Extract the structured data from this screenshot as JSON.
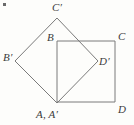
{
  "figure": {
    "background_color": "#fdfdfb",
    "stroke_color": "#7a7a7a",
    "label_color": "#3b3b3b",
    "stroke_width": 1
  },
  "labels": {
    "A": "A, A′",
    "B": "B",
    "C": "C",
    "D": "D",
    "Bp": "B′",
    "Cp": "C′",
    "Dp": "D′"
  },
  "shapes": {
    "square_ABCD": {
      "name": "square ABCD",
      "points": "57,41 115,41 115,102 57,102",
      "vertices": {
        "A": [
          57,
          102
        ],
        "B": [
          57,
          41
        ],
        "C": [
          115,
          41
        ],
        "D": [
          115,
          102
        ]
      }
    },
    "square_ApBpCpDp": {
      "name": "square A'B'C'D'",
      "points": "57,103 15,61 57,18 98,61",
      "vertices": {
        "Ap": [
          57,
          103
        ],
        "Bp": [
          15,
          61
        ],
        "Cp": [
          57,
          18
        ],
        "Dp": [
          98,
          61
        ]
      }
    }
  },
  "artifact": {
    "name": "scan-speck",
    "x": 3,
    "y": 3
  }
}
